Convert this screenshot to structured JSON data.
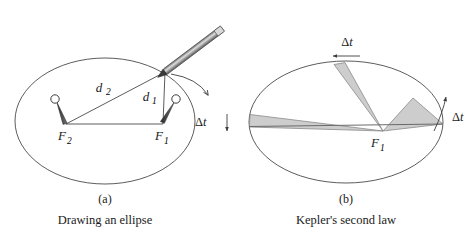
{
  "figure": {
    "background_color": "#ffffff",
    "stroke_color": "#4a4a4a",
    "dark_stroke_color": "#2b2b2b",
    "sector_fill_color": "#cdcdcd",
    "sector_stroke_color": "#8a8a8a"
  },
  "panel_a": {
    "tag": "(a)",
    "caption": "Drawing an ellipse",
    "labels": {
      "focus2": "F",
      "focus2_sub": "2",
      "focus1": "F",
      "focus1_sub": "1",
      "distance2": "d",
      "distance2_sub": "2",
      "distance1": "d",
      "distance1_sub": "1"
    },
    "icons": {
      "pencil": "pencil-icon",
      "pin_left": "pushpin-icon",
      "pin_right": "pushpin-icon",
      "motion_arrow": "curved-arrow-icon"
    }
  },
  "panel_b": {
    "tag": "(b)",
    "caption": "Kepler's second law",
    "labels": {
      "focus1": "F",
      "focus1_sub": "1",
      "delta_top": "Δt",
      "delta_right": "Δt",
      "delta_left": "Δt"
    },
    "icons": {
      "arrow_top": "left-arrow-icon",
      "arrow_right": "curved-up-arrow-icon",
      "arrow_left": "down-arrow-icon"
    },
    "sectors": [
      {
        "name": "top-sector",
        "fill": "#cdcdcd"
      },
      {
        "name": "right-sector",
        "fill": "#cdcdcd"
      },
      {
        "name": "left-sector",
        "fill": "#cdcdcd"
      }
    ]
  }
}
